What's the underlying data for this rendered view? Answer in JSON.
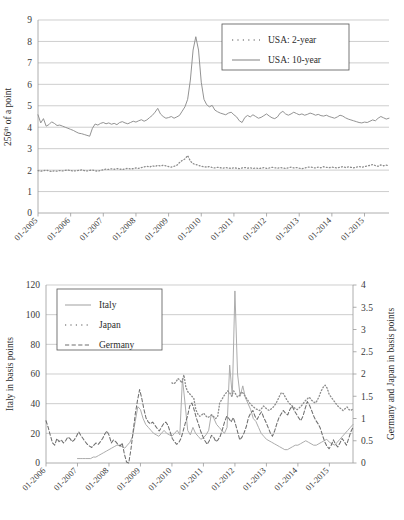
{
  "figure": {
    "name": "two-panel-time-series-figure",
    "background": "#ffffff",
    "line_color": "#8d8d8d",
    "text_color": "#2b2b2b"
  },
  "chart_data": [
    {
      "id": "top",
      "type": "line",
      "title": "",
      "xlabel": "",
      "ylabel": "256th of a point",
      "ylabel_main": "256",
      "ylabel_sup": "th",
      "ylabel_rest": " of a point",
      "ylim": [
        0,
        9
      ],
      "yticks": [
        0,
        1,
        2,
        3,
        4,
        5,
        6,
        7,
        8,
        9
      ],
      "grid": true,
      "legend_position": "top-right",
      "x_start": 2005.0,
      "x_end": 2015.75,
      "xticks": [
        2005,
        2006,
        2007,
        2008,
        2009,
        2010,
        2011,
        2012,
        2013,
        2014,
        2015
      ],
      "xtick_labels": [
        "01-2005",
        "01-2006",
        "01-2007",
        "01-2008",
        "01-2009",
        "01-2010",
        "01-2011",
        "01-2012",
        "01-2013",
        "01-2014",
        "01-2015"
      ],
      "series": [
        {
          "name": "USA: 2-year",
          "style": "dotted",
          "color": "#8d8d8d",
          "values": [
            1.98,
            1.95,
            1.97,
            2.0,
            1.96,
            1.94,
            1.97,
            1.95,
            1.98,
            1.96,
            1.99,
            2.0,
            1.98,
            1.96,
            1.97,
            1.99,
            2.01,
            1.98,
            1.96,
            1.99,
            2.0,
            1.97,
            1.95,
            1.98,
            2.02,
            2.05,
            2.03,
            2.06,
            2.04,
            2.07,
            2.05,
            2.03,
            2.06,
            2.08,
            2.05,
            2.07,
            2.1,
            2.08,
            2.12,
            2.15,
            2.18,
            2.14,
            2.2,
            2.17,
            2.22,
            2.19,
            2.23,
            2.2,
            2.16,
            2.14,
            2.18,
            2.22,
            2.35,
            2.45,
            2.52,
            2.68,
            2.42,
            2.3,
            2.26,
            2.22,
            2.18,
            2.16,
            2.14,
            2.17,
            2.12,
            2.1,
            2.13,
            2.11,
            2.09,
            2.12,
            2.1,
            2.08,
            2.11,
            2.09,
            2.07,
            2.1,
            2.12,
            2.09,
            2.11,
            2.08,
            2.1,
            2.07,
            2.09,
            2.12,
            2.08,
            2.1,
            2.13,
            2.11,
            2.09,
            2.12,
            2.1,
            2.08,
            2.11,
            2.14,
            2.1,
            2.12,
            2.09,
            2.07,
            2.1,
            2.13,
            2.15,
            2.12,
            2.1,
            2.14,
            2.11,
            2.16,
            2.13,
            2.11,
            2.14,
            2.12,
            2.1,
            2.13,
            2.16,
            2.12,
            2.15,
            2.13,
            2.11,
            2.14,
            2.17,
            2.13,
            2.16,
            2.19,
            2.22,
            2.26,
            2.21,
            2.18,
            2.24,
            2.2,
            2.23,
            2.21
          ]
        },
        {
          "name": "USA: 10-year",
          "style": "solid",
          "color": "#8d8d8d",
          "values": [
            4.58,
            4.2,
            4.4,
            4.05,
            4.12,
            4.25,
            4.18,
            4.08,
            4.1,
            4.05,
            4.0,
            3.95,
            3.9,
            3.85,
            3.78,
            3.72,
            3.7,
            3.66,
            3.62,
            3.58,
            3.95,
            4.15,
            4.1,
            4.18,
            4.22,
            4.16,
            4.2,
            4.14,
            4.18,
            4.12,
            4.22,
            4.26,
            4.2,
            4.16,
            4.22,
            4.28,
            4.24,
            4.3,
            4.35,
            4.28,
            4.34,
            4.45,
            4.55,
            4.7,
            4.88,
            4.62,
            4.5,
            4.42,
            4.45,
            4.5,
            4.42,
            4.48,
            4.55,
            4.75,
            4.95,
            5.3,
            6.2,
            7.6,
            8.22,
            7.6,
            6.1,
            5.3,
            5.05,
            4.95,
            5.02,
            4.8,
            4.72,
            4.66,
            4.62,
            4.58,
            4.66,
            4.7,
            4.58,
            4.48,
            4.3,
            4.22,
            4.45,
            4.55,
            4.48,
            4.58,
            4.5,
            4.42,
            4.46,
            4.54,
            4.62,
            4.52,
            4.44,
            4.4,
            4.48,
            4.66,
            4.74,
            4.62,
            4.56,
            4.62,
            4.7,
            4.64,
            4.58,
            4.62,
            4.56,
            4.6,
            4.66,
            4.62,
            4.56,
            4.6,
            4.54,
            4.52,
            4.56,
            4.5,
            4.46,
            4.42,
            4.48,
            4.56,
            4.52,
            4.44,
            4.38,
            4.34,
            4.3,
            4.26,
            4.22,
            4.2,
            4.24,
            4.22,
            4.28,
            4.34,
            4.3,
            4.42,
            4.5,
            4.44,
            4.38,
            4.42
          ]
        }
      ]
    },
    {
      "id": "bottom",
      "type": "line",
      "title": "",
      "xlabel": "",
      "ylabel_left": "Italy in basis points",
      "ylabel_right": "Germany and Japan in basis points",
      "ylim_left": [
        0,
        120
      ],
      "yticks_left": [
        0,
        20,
        40,
        60,
        80,
        100,
        120
      ],
      "ylim_right": [
        0,
        4
      ],
      "yticks_right": [
        0,
        0.5,
        1,
        1.5,
        2,
        2.5,
        3,
        3.5,
        4
      ],
      "ytick_labels_right": [
        "0",
        "0.5",
        "1",
        "1.5",
        "2",
        "2.5",
        "3",
        "3.5",
        "4"
      ],
      "grid": true,
      "legend_position": "top-left",
      "x_start": 2006.0,
      "x_end": 2015.75,
      "xticks": [
        2006,
        2007,
        2008,
        2009,
        2010,
        2011,
        2012,
        2013,
        2014,
        2015
      ],
      "xtick_labels": [
        "01-2006",
        "01-2007",
        "01-2008",
        "01-2009",
        "01-2010",
        "01-2011",
        "01-2012",
        "01-2013",
        "01-2014",
        "01-2015"
      ],
      "series": [
        {
          "name": "Italy",
          "style": "solid",
          "color": "#a8a8a8",
          "axis": "left",
          "x_start": 2007.0,
          "values": [
            3,
            3,
            3,
            3,
            3,
            3,
            4,
            4,
            5,
            6,
            7,
            8,
            9,
            10,
            11,
            12,
            12,
            11,
            10,
            12,
            14,
            18,
            28,
            38,
            36,
            30,
            26,
            24,
            22,
            20,
            19,
            18,
            20,
            22,
            20,
            19,
            18,
            20,
            22,
            19,
            57,
            40,
            22,
            19,
            24,
            20,
            18,
            16,
            17,
            19,
            22,
            33,
            30,
            26,
            24,
            22,
            20,
            24,
            66,
            45,
            116,
            60,
            45,
            52,
            44,
            40,
            36,
            30,
            28,
            24,
            20,
            18,
            16,
            15,
            14,
            13,
            12,
            11,
            10,
            9,
            9,
            10,
            11,
            12,
            12,
            13,
            14,
            15,
            14,
            13,
            12,
            12,
            13,
            14,
            15,
            16,
            14,
            13,
            12,
            14,
            16,
            18,
            20,
            22,
            24,
            26
          ]
        },
        {
          "name": "Japan",
          "style": "dotted",
          "color": "#8d8d8d",
          "axis": "right",
          "x_start": 2010.0,
          "values": [
            1.8,
            1.78,
            1.82,
            1.9,
            1.86,
            1.8,
            1.98,
            1.7,
            1.6,
            1.55,
            1.5,
            1.45,
            1.2,
            1.1,
            1.05,
            1.08,
            1.12,
            1.06,
            1.02,
            1.05,
            1.08,
            1.04,
            1.0,
            1.05,
            1.35,
            1.42,
            1.5,
            1.56,
            1.62,
            1.58,
            1.5,
            1.62,
            1.55,
            1.48,
            1.52,
            1.6,
            1.56,
            1.48,
            1.42,
            1.35,
            1.3,
            1.26,
            1.22,
            1.2,
            1.18,
            1.22,
            1.28,
            1.24,
            1.2,
            1.18,
            1.22,
            1.26,
            1.32,
            1.4,
            1.5,
            1.58,
            1.56,
            1.48,
            1.4,
            1.34,
            1.3,
            1.26,
            1.22,
            1.2,
            1.24,
            1.28,
            1.34,
            1.4,
            1.44,
            1.48,
            1.42,
            1.38,
            1.35,
            1.4,
            1.5,
            1.62,
            1.7,
            1.75,
            1.68,
            1.55,
            1.48,
            1.42,
            1.36,
            1.3,
            1.25,
            1.22,
            1.18,
            1.22,
            1.26,
            1.2,
            1.18,
            1.22
          ]
        },
        {
          "name": "Germany",
          "style": "dashed",
          "color": "#6e6e6e",
          "axis": "right",
          "x_start": 2006.0,
          "values": [
            0.95,
            0.8,
            0.62,
            0.45,
            0.4,
            0.55,
            0.48,
            0.52,
            0.45,
            0.5,
            0.58,
            0.55,
            0.48,
            0.52,
            0.6,
            0.7,
            0.62,
            0.55,
            0.48,
            0.42,
            0.38,
            0.35,
            0.4,
            0.45,
            0.42,
            0.48,
            0.55,
            0.65,
            0.72,
            0.62,
            0.45,
            0.52,
            0.48,
            0.42,
            0.38,
            0.45,
            0.2,
            0.02,
            0.0,
            0.3,
            0.7,
            1.1,
            1.4,
            1.65,
            1.45,
            1.2,
            1.0,
            0.92,
            0.88,
            0.92,
            0.85,
            0.78,
            0.72,
            0.8,
            0.88,
            0.92,
            0.85,
            0.7,
            0.55,
            0.48,
            0.42,
            0.46,
            0.55,
            0.72,
            0.9,
            1.05,
            1.28,
            1.35,
            1.2,
            1.02,
            0.88,
            0.72,
            0.6,
            0.5,
            0.42,
            0.5,
            0.62,
            0.58,
            0.48,
            0.52,
            0.6,
            0.75,
            0.92,
            1.05,
            1.0,
            0.92,
            1.02,
            0.88,
            0.7,
            0.52,
            0.58,
            0.68,
            0.82,
            1.02,
            1.12,
            1.18,
            1.05,
            0.98,
            1.08,
            1.15,
            1.02,
            0.92,
            0.8,
            0.68,
            0.6,
            0.72,
            0.88,
            1.02,
            1.1,
            1.18,
            1.12,
            1.08,
            1.2,
            1.28,
            1.18,
            1.1,
            1.02,
            0.95,
            1.05,
            1.22,
            1.38,
            1.3,
            1.18,
            1.05,
            0.95,
            0.88,
            0.78,
            0.62,
            0.48,
            0.38,
            0.32,
            0.4,
            0.52,
            0.42,
            0.36,
            0.45,
            0.55,
            0.48,
            0.4,
            0.55,
            0.7,
            0.8
          ]
        }
      ]
    }
  ]
}
